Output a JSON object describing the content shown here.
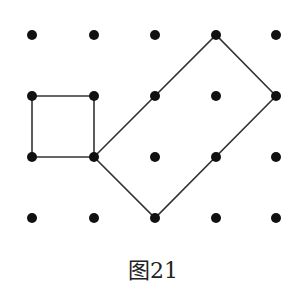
{
  "figure": {
    "caption": "图21",
    "grid": {
      "columns": 5,
      "rows": 4,
      "x": [
        32,
        94,
        155,
        216,
        276
      ],
      "y": [
        35,
        96,
        157,
        218
      ],
      "dot_radius": 5,
      "dot_color": "#111111"
    },
    "shapes": [
      {
        "name": "square",
        "grid_points": [
          [
            0,
            1
          ],
          [
            1,
            1
          ],
          [
            1,
            2
          ],
          [
            0,
            2
          ]
        ],
        "stroke": "#333333"
      },
      {
        "name": "tilted-rectangle",
        "grid_points": [
          [
            1,
            2
          ],
          [
            3,
            0
          ],
          [
            4,
            1
          ],
          [
            2,
            3
          ]
        ],
        "stroke": "#333333"
      }
    ]
  }
}
